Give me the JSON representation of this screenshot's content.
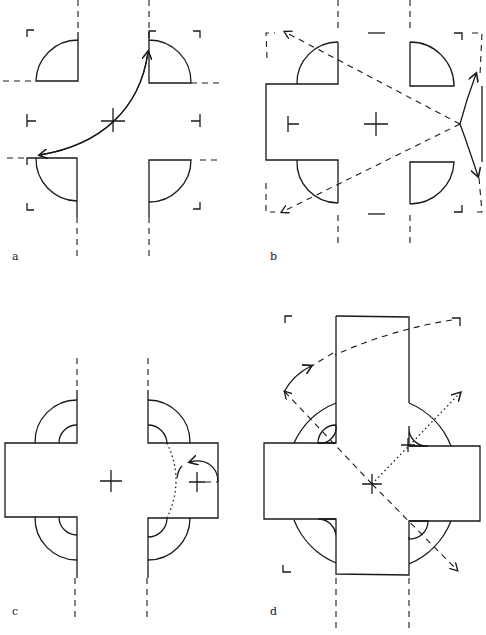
{
  "figure": {
    "panels": [
      {
        "label": "a",
        "description": "Four quadrant wall segments with door-swing arcs; curved double-arrow through centre cross"
      },
      {
        "label": "b",
        "description": "Cross-shaped plan with left arm; dashed diagonal arrows from right node to corners"
      },
      {
        "label": "c",
        "description": "Cross with wide horizontal arm; double concentric arcs; dotted arc and curved arrow near right cross"
      },
      {
        "label": "d",
        "description": "Latin cross with tall top arm; half-disc niches; dashed diagonal axes with arrows"
      }
    ]
  }
}
